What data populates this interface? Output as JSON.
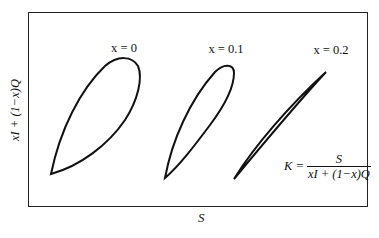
{
  "diagram": {
    "axes": {
      "x_label": "S",
      "y_label": "xI + (1−x)Q"
    },
    "loops": [
      {
        "label": "x = 0",
        "x_value": 0,
        "shape": "wide-loop"
      },
      {
        "label": "x = 0.1",
        "x_value": 0.1,
        "shape": "narrower-loop"
      },
      {
        "label": "x = 0.2",
        "x_value": 0.2,
        "shape": "nearly-straight-line"
      }
    ],
    "formula": {
      "lhs": "K =",
      "numerator": "S",
      "denominator": "xI + (1−x)Q"
    },
    "colors": {
      "stroke": "#111111",
      "frame": "#222222",
      "background": "#ffffff"
    }
  }
}
